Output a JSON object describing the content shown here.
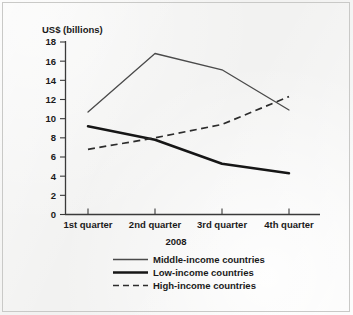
{
  "chart_data": {
    "type": "line",
    "title": "",
    "subtitle": "",
    "xlabel": "2008",
    "ylabel": "US$ (billions)",
    "categories": [
      "1st quarter",
      "2nd quarter",
      "3rd quarter",
      "4th quarter"
    ],
    "ylim": [
      0,
      18
    ],
    "yticks": [
      0,
      2,
      4,
      6,
      8,
      10,
      12,
      14,
      16,
      18
    ],
    "ytick_labels": [
      "0",
      "2",
      "4",
      "6",
      "8",
      "10",
      "12",
      "14",
      "16",
      "18"
    ],
    "grid": false,
    "legend_position": "bottom",
    "series": [
      {
        "name": "Middle-income countries",
        "style": "solid-thin",
        "color": "#4a4a4a",
        "values": [
          10.7,
          16.8,
          15.1,
          10.9
        ]
      },
      {
        "name": "Low-income countries",
        "style": "solid-thick",
        "color": "#161616",
        "values": [
          9.2,
          7.8,
          5.3,
          4.3
        ]
      },
      {
        "name": "High-income countries",
        "style": "dashed",
        "color": "#2c2c2c",
        "values": [
          6.8,
          8.0,
          9.4,
          12.3
        ]
      }
    ]
  },
  "legend": {
    "items": [
      {
        "label": "Middle-income countries"
      },
      {
        "label": "Low-income countries"
      },
      {
        "label": "High-income countries"
      }
    ]
  }
}
